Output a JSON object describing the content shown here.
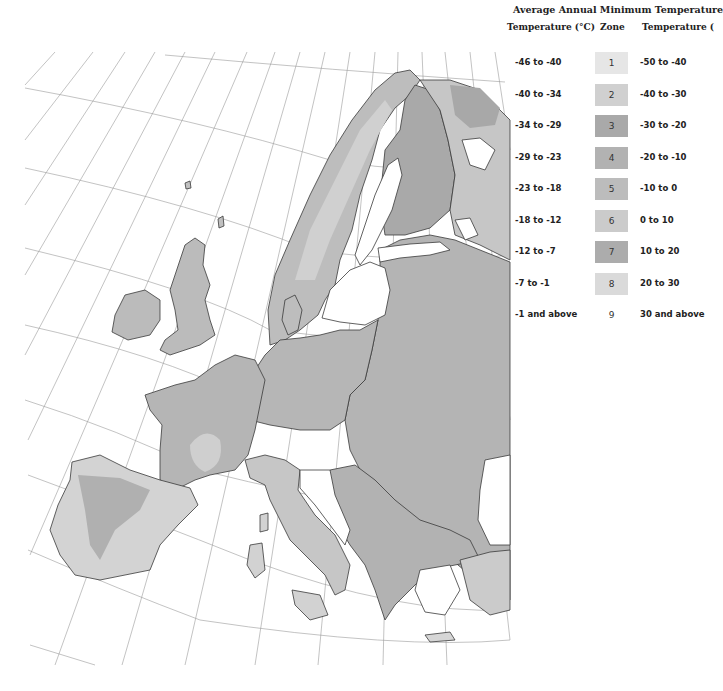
{
  "legend": {
    "title": "Average Annual Minimum Temperature",
    "headers": {
      "celsius": "Temperature (°C)",
      "zone": "Zone",
      "fahrenheit": "Temperature ("
    },
    "rows": [
      {
        "celsius": "-46 to -40",
        "zone": "1",
        "fahrenheit": "-50 to -40",
        "color": "#e6e6e6"
      },
      {
        "celsius": "-40 to -34",
        "zone": "2",
        "fahrenheit": "-40 to -30",
        "color": "#d0d0d0"
      },
      {
        "celsius": "-34 to -29",
        "zone": "3",
        "fahrenheit": "-30 to -20",
        "color": "#a9a9a9"
      },
      {
        "celsius": "-29 to -23",
        "zone": "4",
        "fahrenheit": "-20 to -10",
        "color": "#b2b2b2"
      },
      {
        "celsius": "-23 to -18",
        "zone": "5",
        "fahrenheit": "-10 to 0",
        "color": "#bcbcbc"
      },
      {
        "celsius": "-18 to -12",
        "zone": "6",
        "fahrenheit": "0 to 10",
        "color": "#cbcbcb"
      },
      {
        "celsius": "-12 to -7",
        "zone": "7",
        "fahrenheit": "10 to 20",
        "color": "#acacac"
      },
      {
        "celsius": "-7 to -1",
        "zone": "8",
        "fahrenheit": "20 to 30",
        "color": "#dadada"
      },
      {
        "celsius": "-1 and above",
        "zone": "9",
        "fahrenheit": "30 and above",
        "color": "#ffffff"
      }
    ]
  },
  "map": {
    "region": "Europe",
    "colors": {
      "sea": "#ffffff",
      "land": "#b9b9b9",
      "land_light": "#d4d4d4",
      "land_dark": "#a4a4a4",
      "border": "#3a3a3a",
      "graticule": "#9a9a9a"
    }
  }
}
